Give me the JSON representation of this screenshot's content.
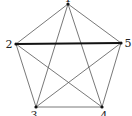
{
  "diagram": {
    "type": "complete-graph-K5",
    "vertices": [
      {
        "id": "1",
        "label": "1",
        "x": 68,
        "y": 4,
        "lx": 68,
        "ly": 2,
        "anchor": "middle"
      },
      {
        "id": "2",
        "label": "2",
        "x": 16,
        "y": 44,
        "lx": 9,
        "ly": 48,
        "anchor": "middle"
      },
      {
        "id": "3",
        "label": "3",
        "x": 36,
        "y": 107,
        "lx": 34,
        "ly": 119,
        "anchor": "middle"
      },
      {
        "id": "4",
        "label": "4",
        "x": 102,
        "y": 107,
        "lx": 104,
        "ly": 119,
        "anchor": "middle"
      },
      {
        "id": "5",
        "label": "5",
        "x": 121,
        "y": 43,
        "lx": 128,
        "ly": 47,
        "anchor": "middle"
      }
    ],
    "edges": [
      {
        "from": "1",
        "to": "2",
        "bold": false
      },
      {
        "from": "1",
        "to": "3",
        "bold": false
      },
      {
        "from": "1",
        "to": "4",
        "bold": false
      },
      {
        "from": "1",
        "to": "5",
        "bold": false
      },
      {
        "from": "2",
        "to": "3",
        "bold": false
      },
      {
        "from": "2",
        "to": "4",
        "bold": false
      },
      {
        "from": "2",
        "to": "5",
        "bold": true
      },
      {
        "from": "3",
        "to": "4",
        "bold": false
      },
      {
        "from": "3",
        "to": "5",
        "bold": false
      },
      {
        "from": "4",
        "to": "5",
        "bold": false
      }
    ]
  }
}
